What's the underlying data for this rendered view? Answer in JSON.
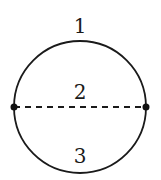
{
  "diagram": {
    "type": "circle-with-chord",
    "circle": {
      "cx": 80,
      "cy": 107,
      "r": 66,
      "stroke": "#1a1a1a",
      "stroke_width": 1.8
    },
    "chord": {
      "x1": 14,
      "y1": 107,
      "x2": 146,
      "y2": 107,
      "style": "dashed",
      "dash": "6 5"
    },
    "nodes": [
      {
        "id": "left",
        "cx": 14,
        "cy": 107,
        "r": 3.5
      },
      {
        "id": "right",
        "cx": 146,
        "cy": 107,
        "r": 3.5
      }
    ],
    "labels": [
      {
        "id": "arc-top",
        "text": "1",
        "x": 80,
        "y": 33
      },
      {
        "id": "chord",
        "text": "2",
        "x": 80,
        "y": 99
      },
      {
        "id": "arc-bottom",
        "text": "3",
        "x": 80,
        "y": 163
      }
    ]
  }
}
